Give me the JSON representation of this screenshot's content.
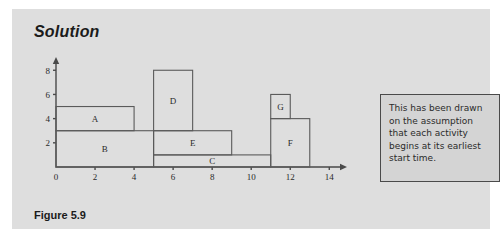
{
  "page": {
    "title": "Solution",
    "caption": "Figure 5.9"
  },
  "note": {
    "text": "This has been drawn on the assumption that each activity begins at its earliest start time."
  },
  "chart_data": {
    "type": "bar",
    "title": "",
    "xlabel": "",
    "ylabel": "",
    "xlim": [
      0,
      14.6
    ],
    "ylim": [
      0,
      8.6
    ],
    "grid": false,
    "legend": null,
    "xticks": [
      0,
      2,
      4,
      6,
      8,
      10,
      12,
      14
    ],
    "xtick_labels": [
      "0",
      "2",
      "4",
      "6",
      "8",
      "10",
      "12",
      "14"
    ],
    "yticks": [
      2,
      4,
      6,
      8
    ],
    "ytick_labels": [
      "2",
      "4",
      "6",
      "8"
    ],
    "blocks": [
      {
        "label": "A",
        "x_start": 0,
        "x_end": 4,
        "y_bottom": 3,
        "y_top": 5
      },
      {
        "label": "B",
        "x_start": 0,
        "x_end": 5,
        "y_bottom": 0,
        "y_top": 3
      },
      {
        "label": "D",
        "x_start": 5,
        "x_end": 7,
        "y_bottom": 3,
        "y_top": 8
      },
      {
        "label": "E",
        "x_start": 5,
        "x_end": 9,
        "y_bottom": 1,
        "y_top": 3
      },
      {
        "label": "C",
        "x_start": 5,
        "x_end": 11,
        "y_bottom": 0,
        "y_top": 1
      },
      {
        "label": "G",
        "x_start": 11,
        "x_end": 12,
        "y_bottom": 4,
        "y_top": 6
      },
      {
        "label": "F",
        "x_start": 11,
        "x_end": 13,
        "y_bottom": 0,
        "y_top": 4
      }
    ]
  }
}
